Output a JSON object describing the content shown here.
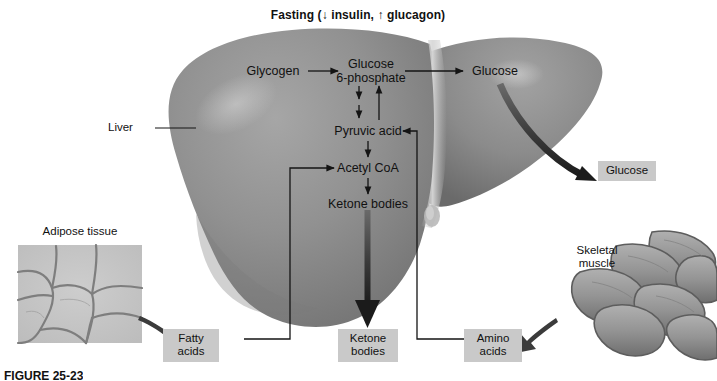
{
  "figure": {
    "title": "Fasting (↓ insulin, ↑ glucagon)",
    "caption": "FIGURE 25-23"
  },
  "colors": {
    "liver_base": "#8d8d8d",
    "liver_dark": "#6f6f6f",
    "liver_light": "#b4b4b4",
    "liver_highlight": "#c9c9c9",
    "box_fill": "#c9c9c9",
    "arrow": "#141414",
    "text": "#111111",
    "adipose_fill": "#c6c6c6",
    "adipose_line": "#7c7c7c",
    "muscle_fill": "#9a9a9a",
    "muscle_line": "#5d5d5d",
    "background": "#ffffff"
  },
  "organs": [
    {
      "name": "liver",
      "label": "Liver",
      "label_x": 130,
      "label_y": 123
    },
    {
      "name": "adipose-tissue",
      "label": "Adipose tissue",
      "label_x": 80,
      "label_y": 231
    },
    {
      "name": "skeletal-muscle",
      "label": "Skeletal\nmuscle",
      "label_line1": "Skeletal",
      "label_line2": "muscle",
      "label_x": 596,
      "label_y": 252
    }
  ],
  "pathway_nodes": [
    {
      "id": "glycogen",
      "label": "Glycogen",
      "x": 273,
      "y": 71
    },
    {
      "id": "glucose-6-phosphate",
      "label_line1": "Glucose",
      "label_line2": "6-phosphate",
      "x": 368,
      "y": 64
    },
    {
      "id": "glucose-internal",
      "label": "Glucose",
      "x": 494,
      "y": 71
    },
    {
      "id": "pyruvic-acid",
      "label": "Pyruvic acid",
      "x": 368,
      "y": 131
    },
    {
      "id": "acetyl-coa",
      "label": "Acetyl CoA",
      "x": 368,
      "y": 168
    },
    {
      "id": "ketone-bodies-internal",
      "label": "Ketone bodies",
      "x": 368,
      "y": 204
    }
  ],
  "output_boxes": [
    {
      "id": "glucose-output",
      "label": "Glucose",
      "x": 598,
      "y": 163,
      "width": 56,
      "height": 20
    },
    {
      "id": "fatty-acids-output",
      "label_line1": "Fatty",
      "label_line2": "acids",
      "x": 190,
      "y": 331,
      "width": 54,
      "height": 32
    },
    {
      "id": "ketone-bodies-output",
      "label_line1": "Ketone",
      "label_line2": "bodies",
      "x": 338,
      "y": 331,
      "width": 60,
      "height": 32
    },
    {
      "id": "amino-acids-output",
      "label_line1": "Amino",
      "label_line2": "acids",
      "x": 464,
      "y": 331,
      "width": 58,
      "height": 32
    }
  ],
  "flows": [
    {
      "from": "glycogen",
      "to": "glucose-6-phosphate",
      "style": "thin"
    },
    {
      "from": "glucose-6-phosphate",
      "to": "glucose-internal",
      "style": "thin"
    },
    {
      "from": "glucose-6-phosphate",
      "to": "pyruvic-acid",
      "style": "thin-double"
    },
    {
      "from": "pyruvic-acid",
      "to": "glucose-6-phosphate",
      "style": "thin-return"
    },
    {
      "from": "pyruvic-acid",
      "to": "acetyl-coa",
      "style": "thin"
    },
    {
      "from": "acetyl-coa",
      "to": "ketone-bodies-internal",
      "style": "thin"
    },
    {
      "from": "glucose-internal",
      "to": "glucose-output",
      "style": "thick-curved"
    },
    {
      "from": "ketone-bodies-internal",
      "to": "ketone-bodies-output",
      "style": "thick-straight"
    },
    {
      "from": "fatty-acids-output",
      "to": "acetyl-coa",
      "style": "thin-elbow"
    },
    {
      "from": "amino-acids-output",
      "to": "pyruvic-acid",
      "style": "thin-elbow"
    },
    {
      "from": "adipose-tissue",
      "to": "fatty-acids-output",
      "style": "tapered-curve"
    },
    {
      "from": "skeletal-muscle",
      "to": "amino-acids-output",
      "style": "tapered-curve"
    }
  ]
}
